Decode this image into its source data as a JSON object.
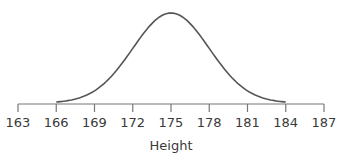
{
  "chart_data": {
    "type": "line",
    "title": "",
    "xlabel": "Height",
    "ylabel": "",
    "distribution": {
      "mean": 175,
      "sd": 3
    },
    "x_ticks": [
      163,
      166,
      169,
      172,
      175,
      178,
      181,
      184,
      187
    ],
    "xlim": [
      163,
      187
    ],
    "curve_range": [
      166,
      184
    ],
    "grid": false,
    "legend": null
  },
  "colors": {
    "curve": "#555555",
    "axis": "#777777",
    "text": "#3a3a3a"
  }
}
